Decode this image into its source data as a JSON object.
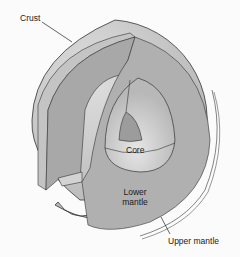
{
  "diagram": {
    "labels": {
      "crust": "Crust",
      "core": "Core",
      "lower_mantle_line1": "Lower",
      "lower_mantle_line2": "mantle",
      "upper_mantle": "Upper mantle"
    },
    "colors": {
      "background": "#fbfbfb",
      "crust_shell": "#c9c9c9",
      "crust_light": "#d9d9d9",
      "upper_mantle": "#bdbdbd",
      "lower_mantle": "#a9a9a9",
      "lower_mantle_inner": "#b3b3b3",
      "core_outer": "#dcdcdc",
      "core_inner": "#9a9a9a",
      "outline": "#333333"
    }
  }
}
